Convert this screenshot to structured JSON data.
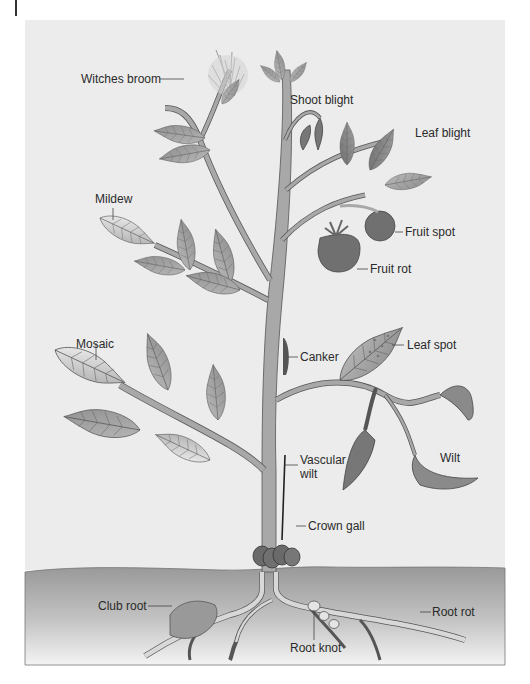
{
  "figure": {
    "type": "illustration",
    "colors": {
      "sky_panel": "#ececec",
      "soil_top": "#9a9a9a",
      "soil_bottom": "#f2f2f2",
      "leaf": "#9c9c9c",
      "leaf_light": "#c8c8c8",
      "leaf_edge": "#555555",
      "stem": "#a8a8a8",
      "fruit": "#707070",
      "text": "#2a2a2a"
    }
  },
  "labels": {
    "witches_broom": "Witches broom",
    "shoot_blight": "Shoot blight",
    "leaf_blight": "Leaf blight",
    "mildew": "Mildew",
    "fruit_spot": "Fruit spot",
    "fruit_rot": "Fruit rot",
    "leaf_spot": "Leaf spot",
    "canker": "Canker",
    "mosaic": "Mosaic",
    "vascular_wilt_line1": "Vascular",
    "vascular_wilt_line2": "wilt",
    "wilt": "Wilt",
    "crown_gall": "Crown gall",
    "club_root": "Club root",
    "root_rot": "Root rot",
    "root_knot": "Root knot"
  }
}
